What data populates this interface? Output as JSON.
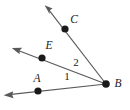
{
  "figure": {
    "type": "geometry-diagram",
    "background_color": "#ffffff",
    "line_color": "#59595b",
    "point_color": "#1a1a1a",
    "label_color": "#1a1a1a"
  },
  "vertex": {
    "name": "B",
    "label": "B",
    "x": 106,
    "y": 84,
    "label_x": 117,
    "label_y": 84
  },
  "rays": [
    {
      "id": "ray-ba",
      "name": "ray-BA",
      "through_point": "A",
      "point_label": "A",
      "point_x": 38,
      "point_y": 91,
      "label_x": 37,
      "label_y": 79,
      "from_x": 106,
      "from_y": 84,
      "to_x": 4,
      "to_y": 95,
      "arrow_at": "end"
    },
    {
      "id": "ray-be",
      "name": "ray-BE",
      "through_point": "E",
      "point_label": "E",
      "point_x": 42,
      "point_y": 58,
      "label_x": 49,
      "label_y": 46,
      "from_x": 106,
      "from_y": 84,
      "to_x": 12,
      "to_y": 48,
      "arrow_at": "end"
    },
    {
      "id": "ray-bc",
      "name": "ray-BC",
      "through_point": "C",
      "point_label": "C",
      "point_x": 65,
      "point_y": 29,
      "label_x": 74,
      "label_y": 20,
      "from_x": 106,
      "from_y": 84,
      "to_x": 45,
      "to_y": 5,
      "arrow_at": "end"
    }
  ],
  "angles": [
    {
      "id": "angle-1",
      "name": "angle-label-1",
      "label": "1",
      "x": 67,
      "y": 77,
      "between": "ray-BA and ray-BE"
    },
    {
      "id": "angle-2",
      "name": "angle-label-2",
      "label": "2",
      "x": 76,
      "y": 63,
      "between": "ray-BE and ray-BC"
    }
  ]
}
